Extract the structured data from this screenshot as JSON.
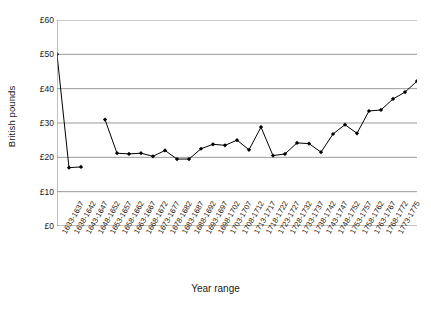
{
  "chart_data": {
    "type": "line",
    "title": "",
    "xlabel": "Year range",
    "ylabel": "British pounds",
    "ylim": [
      0,
      60
    ],
    "ytick_values": [
      0,
      10,
      20,
      30,
      40,
      50,
      60
    ],
    "ytick_labels": [
      "£0",
      "£10",
      "£20",
      "£30",
      "£40",
      "£50",
      "£60"
    ],
    "grid": "horizontal",
    "legend": "none",
    "marker": "diamond",
    "line_color": "#000000",
    "marker_color": "#000000",
    "grid_color": "#808080",
    "axis_color": "#808080",
    "background": "#ffffff",
    "categories": [
      "1633-1637",
      "1638-1642",
      "1643-1647",
      "1648-1652",
      "1653-1657",
      "1658-1662",
      "1663-1667",
      "1668-1672",
      "1673-1677",
      "1678-1682",
      "1683-1687",
      "1688-1692",
      "1693-1697",
      "1698-1702",
      "1703-1707",
      "1708-1712",
      "1713-1717",
      "1718-1722",
      "1723-1727",
      "1728-1732",
      "1733-1737",
      "1738-1742",
      "1743-1747",
      "1748-1752",
      "1753-1757",
      "1758-1762",
      "1763-1767",
      "1768-1772",
      "1773-1775"
    ],
    "values": [
      50.0,
      17.0,
      17.2,
      null,
      31.0,
      21.2,
      21.0,
      21.2,
      20.3,
      22.0,
      19.5,
      19.5,
      22.5,
      23.8,
      23.5,
      25.0,
      22.2,
      28.8,
      20.5,
      21.0,
      24.2,
      24.0,
      21.5,
      26.8,
      29.5,
      27.0,
      33.5,
      33.8,
      37.0
    ],
    "values_tail": [
      39.0,
      42.2
    ]
  }
}
